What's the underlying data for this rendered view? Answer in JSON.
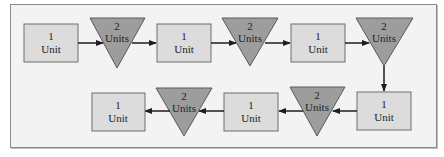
{
  "diagram": {
    "colors": {
      "background": "#f3f3f3",
      "panel_border": "#8a8a8a",
      "box_fill": "#dcdcdc",
      "box_stroke": "#6e6e6e",
      "triangle_fill": "#9d9d9d",
      "triangle_stroke": "#5a5a5a",
      "arrow": "#1e1e1e"
    },
    "nodes": [
      {
        "id": "box1",
        "shape": "rectangle",
        "number": "1",
        "unit": "Unit"
      },
      {
        "id": "tri1",
        "shape": "inverted-triangle",
        "number": "2",
        "unit": "Units"
      },
      {
        "id": "box2",
        "shape": "rectangle",
        "number": "1",
        "unit": "Unit"
      },
      {
        "id": "tri2",
        "shape": "inverted-triangle",
        "number": "2",
        "unit": "Units"
      },
      {
        "id": "box3",
        "shape": "rectangle",
        "number": "1",
        "unit": "Unit"
      },
      {
        "id": "tri3",
        "shape": "inverted-triangle",
        "number": "2",
        "unit": "Units"
      },
      {
        "id": "box4",
        "shape": "rectangle",
        "number": "1",
        "unit": "Unit"
      },
      {
        "id": "tri4",
        "shape": "inverted-triangle",
        "number": "2",
        "unit": "Units"
      },
      {
        "id": "box5",
        "shape": "rectangle",
        "number": "1",
        "unit": "Unit"
      },
      {
        "id": "tri5",
        "shape": "inverted-triangle",
        "number": "2",
        "unit": "Units"
      },
      {
        "id": "box6",
        "shape": "rectangle",
        "number": "1",
        "unit": "Unit"
      }
    ],
    "flow": [
      "box1",
      "tri1",
      "box2",
      "tri2",
      "box3",
      "tri3",
      "box4",
      "tri4",
      "box5",
      "tri5",
      "box6"
    ]
  }
}
